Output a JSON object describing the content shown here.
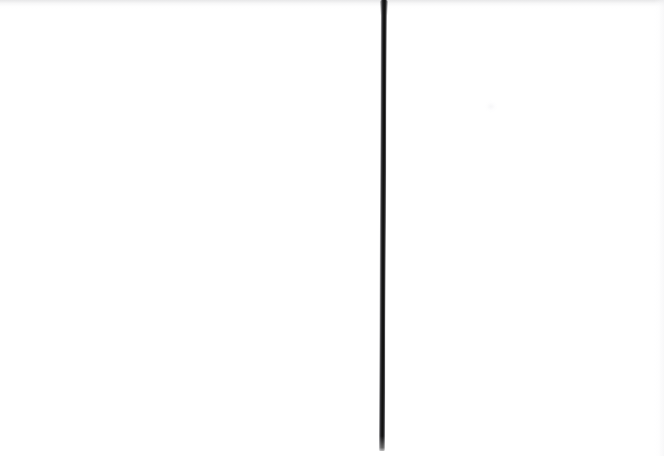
{
  "image": {
    "kind": "scanned-blank-page",
    "title": "Blank scanned page with a single vertical stroke",
    "width": 664,
    "height": 456,
    "background_color": "#FFFFFF",
    "visible_text": "",
    "notes": "No text, numbers, labels, icons or UI chrome are rendered anywhere in the image."
  },
  "marks": [
    {
      "name": "vertical-stroke",
      "shape": "line",
      "orientation": "vertical",
      "color": "#141414",
      "edge_color": "#787878",
      "stroke_width_px": 6,
      "x_center_px": 384,
      "x_top_px": 385,
      "x_bottom_px": 383,
      "y_start_px": 0,
      "y_end_px": 450,
      "length_px": 450,
      "lean_degrees": 0.26,
      "cap_top": "flush-with-image-edge",
      "cap_bottom": "tapered-fade",
      "antialiased": true
    }
  ],
  "artifacts": [
    {
      "name": "scan-top-tint",
      "description": "faint warm-gray tint band along the top edge",
      "color": "#B0B0B4",
      "x_px": 0,
      "y_px": 0,
      "width_px": 664,
      "height_px": 9
    },
    {
      "name": "scan-right-edge",
      "description": "subtle vertical tonal edge near the right margin",
      "color": "#F2F2F4",
      "x_px": 654,
      "y_px": 0,
      "width_px": 10,
      "height_px": 456
    },
    {
      "name": "scan-smudge",
      "description": "barely visible light smudge",
      "color": "#F6F6F8",
      "x_px": 484,
      "y_px": 100,
      "width_px": 14,
      "height_px": 13
    }
  ]
}
